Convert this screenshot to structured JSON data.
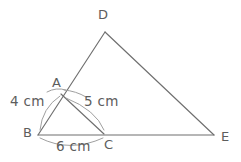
{
  "figure": {
    "canvas": {
      "width": 241,
      "height": 162
    },
    "stroke_color": "#6f6f6f",
    "arc_color": "#9a9a9a",
    "text_color": "#5d5d5d",
    "background": "#ffffff"
  },
  "vertices": {
    "A": {
      "label": "A",
      "x": 61,
      "y": 94,
      "label_x": 52,
      "label_y": 76
    },
    "B": {
      "label": "B",
      "x": 38,
      "y": 135,
      "label_x": 23,
      "label_y": 126
    },
    "C": {
      "label": "C",
      "x": 104,
      "y": 134,
      "label_x": 104,
      "label_y": 138
    },
    "D": {
      "label": "D",
      "x": 105,
      "y": 32,
      "label_x": 98,
      "label_y": 8
    },
    "E": {
      "label": "E",
      "x": 214,
      "y": 135,
      "label_x": 221,
      "label_y": 130
    }
  },
  "segments": [
    {
      "name": "BD",
      "from": "B",
      "to": "D"
    },
    {
      "name": "DE",
      "from": "D",
      "to": "E"
    },
    {
      "name": "BE",
      "from": "B",
      "to": "E"
    },
    {
      "name": "AC",
      "from": "A",
      "to": "C"
    }
  ],
  "measurements": [
    {
      "name": "AB",
      "text": "4 cm",
      "x": 10,
      "y": 94
    },
    {
      "name": "AC",
      "text": "5 cm",
      "x": 84,
      "y": 94
    },
    {
      "name": "BC",
      "text": "6 cm",
      "x": 56,
      "y": 139
    }
  ],
  "arcs": [
    {
      "name": "arc-b-to-a",
      "d": "M 40 130 Q 42 108 60 96"
    },
    {
      "name": "arc-a-left",
      "d": "M 47 92 Q 56 87 66 90"
    },
    {
      "name": "arc-a-right",
      "d": "M 64 90 Q 76 91 86 97"
    },
    {
      "name": "arc-a-to-c",
      "d": "M 66 98 Q 96 110 104 130"
    },
    {
      "name": "arc-b-to-c",
      "d": "M 40 138 Q 70 153 103 138"
    }
  ]
}
